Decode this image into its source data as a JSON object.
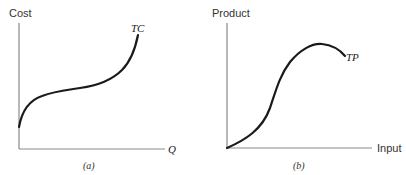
{
  "panels": [
    {
      "id": "a",
      "caption": "(a)",
      "y_axis_label": "Cost",
      "x_axis_label": "Q",
      "curve_label": "TC",
      "curve_description": "Total cost curve: positive intercept, concave then convex (cubic shape)"
    },
    {
      "id": "b",
      "caption": "(b)",
      "y_axis_label": "Product",
      "x_axis_label": "Input",
      "curve_label": "TP",
      "curve_description": "Total product curve: starts at origin, convex then concave, reaches maximum then declines"
    }
  ],
  "colors": {
    "axis": "#8a8a8a",
    "curve": "#1a1a1a",
    "background": "#ffffff"
  }
}
